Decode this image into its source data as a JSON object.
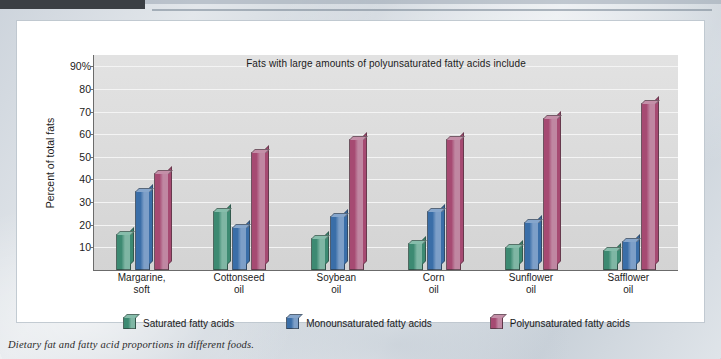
{
  "caption": "Dietary fat and fatty acid proportions in different foods.",
  "chart_data": {
    "type": "bar",
    "title": "Fats with large amounts of polyunsaturated fatty acids include",
    "xlabel": "",
    "ylabel": "Percent of total fats",
    "ylim": [
      0,
      95
    ],
    "grid": true,
    "legend_position": "bottom",
    "ytick_labels": [
      "90%",
      "80",
      "70",
      "60",
      "50",
      "40",
      "30",
      "20",
      "10"
    ],
    "ytick_values": [
      90,
      80,
      70,
      60,
      50,
      40,
      30,
      20,
      10
    ],
    "categories": [
      "Margarine,\nsoft",
      "Cottonseed\noil",
      "Soybean\noil",
      "Corn\noil",
      "Sunflower\noil",
      "Safflower\noil"
    ],
    "categories_display": [
      [
        "Margarine,",
        "soft"
      ],
      [
        "Cottonseed",
        "oil"
      ],
      [
        "Soybean",
        "oil"
      ],
      [
        "Corn",
        "oil"
      ],
      [
        "Sunflower",
        "oil"
      ],
      [
        "Safflower",
        "oil"
      ]
    ],
    "series": [
      {
        "name": "Saturated fatty acids",
        "color": "#3d8a72",
        "color_light": "#7fb6a4",
        "color_top": "#86bdab",
        "values": [
          16,
          26,
          14,
          12,
          10,
          9
        ]
      },
      {
        "name": "Monounsaturated fatty acids",
        "color": "#3a6ea8",
        "color_light": "#7d9fc8",
        "color_top": "#86a6cc",
        "values": [
          35,
          19,
          24,
          26,
          21,
          13
        ]
      },
      {
        "name": "Polyunsaturated fatty acids",
        "color": "#a64a72",
        "color_light": "#c087a2",
        "color_top": "#c48fa8",
        "values": [
          43,
          52,
          58,
          58,
          67,
          74
        ]
      }
    ]
  }
}
